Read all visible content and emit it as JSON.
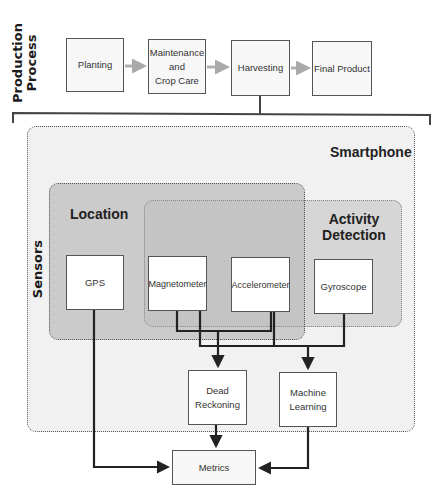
{
  "side_labels": {
    "production": "Production\nProcess",
    "sensors": "Sensors"
  },
  "production_process": {
    "steps": [
      {
        "label": "Planting"
      },
      {
        "label": "Maintenance\nand\nCrop Care"
      },
      {
        "label": "Harvesting"
      },
      {
        "label": "Final Product"
      }
    ]
  },
  "smartphone": {
    "label": "Smartphone",
    "groups": {
      "location": "Location",
      "activity": "Activity\nDetection"
    },
    "sensors": [
      {
        "label": "GPS"
      },
      {
        "label": "Magnetometer"
      },
      {
        "label": "Accelerometer"
      },
      {
        "label": "Gyroscope"
      }
    ],
    "processing": [
      {
        "label": "Dead\nReckoning"
      },
      {
        "label": "Machine\nLearning"
      }
    ]
  },
  "output": {
    "label": "Metrics"
  },
  "colors": {
    "smartphone_bg": "#f1f1f1",
    "location_bg": "#c9c9c9",
    "activity_bg": "#d6d6d6",
    "overlap_bg": "#bdbdbd",
    "process_arrow": "#b0b0b0",
    "wire": "#222222"
  }
}
